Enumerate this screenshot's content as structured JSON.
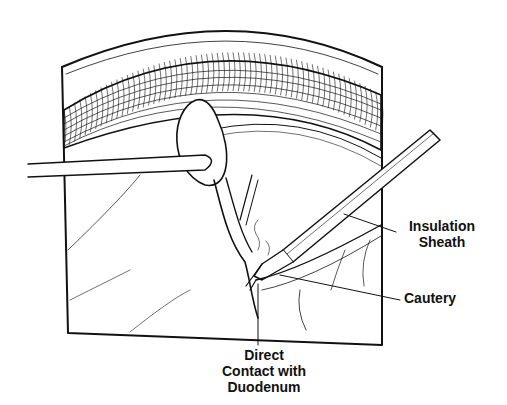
{
  "figure": {
    "type": "surgical line illustration",
    "labels": {
      "insulation_sheath_line1": "Insulation",
      "insulation_sheath_line2": "Sheath",
      "cautery": "Cautery",
      "direct_contact_line1": "Direct",
      "direct_contact_line2": "Contact with",
      "direct_contact_line3": "Duodenum"
    },
    "colors": {
      "ink": "#111111",
      "background": "#ffffff"
    }
  }
}
